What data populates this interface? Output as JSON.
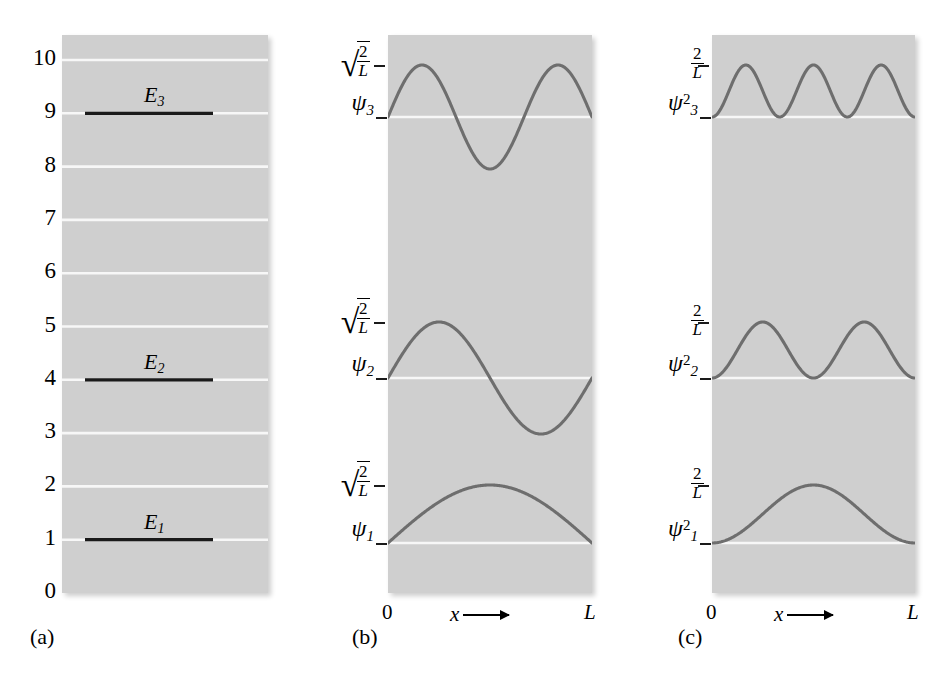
{
  "figure": {
    "background_color": "#ffffff",
    "panel_fill_color": "#cfcfcf",
    "gridline_color": "#f7f7f7",
    "curve_color": "#6e6e6e",
    "level_line_color": "#1a1a1a"
  },
  "captions": {
    "a": "(a)",
    "b": "(b)",
    "c": "(c)"
  },
  "panel_a": {
    "name": "energy-level-diagram",
    "y_tick_labels": [
      "10",
      "9",
      "8",
      "7",
      "6",
      "5",
      "4",
      "3",
      "2",
      "1",
      "0"
    ],
    "y_tick_values": [
      10,
      9,
      8,
      7,
      6,
      5,
      4,
      3,
      2,
      1,
      0
    ],
    "levels": [
      {
        "label": "E",
        "subscript": "3",
        "value": 9
      },
      {
        "label": "E",
        "subscript": "2",
        "value": 4
      },
      {
        "label": "E",
        "subscript": "1",
        "value": 1
      }
    ]
  },
  "panel_b": {
    "name": "wavefunction-panel",
    "amplitude_label": {
      "radical": "√",
      "numerator": "2",
      "denominator": "L"
    },
    "baseline_labels": [
      {
        "symbol": "ψ",
        "subscript": "3",
        "superscript": ""
      },
      {
        "symbol": "ψ",
        "subscript": "2",
        "superscript": ""
      },
      {
        "symbol": "ψ",
        "subscript": "1",
        "superscript": ""
      }
    ],
    "x_axis": {
      "left": "0",
      "variable": "x",
      "right": "L"
    }
  },
  "panel_c": {
    "name": "probability-density-panel",
    "amplitude_label": {
      "numerator": "2",
      "denominator": "L"
    },
    "baseline_labels": [
      {
        "symbol": "ψ",
        "subscript": "3",
        "superscript": "2"
      },
      {
        "symbol": "ψ",
        "subscript": "2",
        "superscript": "2"
      },
      {
        "symbol": "ψ",
        "subscript": "1",
        "superscript": "2"
      }
    ],
    "x_axis": {
      "left": "0",
      "variable": "x",
      "right": "L"
    }
  },
  "chart_data": {
    "type": "line",
    "panels": [
      {
        "id": "a",
        "label": "(a)",
        "type": "bar",
        "description": "Horizontal energy level lines on a gridded scale of relative energy",
        "ylabel": "",
        "ylim": [
          0,
          10
        ],
        "yticks": [
          0,
          1,
          2,
          3,
          4,
          5,
          6,
          7,
          8,
          9,
          10
        ],
        "ytick_labels": [
          "0",
          "1",
          "2",
          "3",
          "4",
          "5",
          "6",
          "7",
          "8",
          "9",
          "10"
        ],
        "grid": true,
        "categories": [
          "E1",
          "E2",
          "E3"
        ],
        "values": [
          1,
          4,
          9
        ],
        "annotations": [
          "E_1 at 1",
          "E_2 at 4",
          "E_3 at 9"
        ]
      },
      {
        "id": "b",
        "label": "(b)",
        "type": "line",
        "description": "Wavefunctions psi_n = sqrt(2/L) sin(n pi x / L) plotted from x=0 to x=L",
        "xlabel": "x",
        "xlim": [
          0,
          1
        ],
        "xtick_labels": [
          "0",
          "L"
        ],
        "grid": false,
        "series": [
          {
            "name": "psi_3",
            "n": 3,
            "amplitude": 1,
            "baseline": 0,
            "half_periods": 3,
            "peaks": 2,
            "troughs": 1
          },
          {
            "name": "psi_2",
            "n": 2,
            "amplitude": 1,
            "baseline": 0,
            "half_periods": 2,
            "peaks": 1,
            "troughs": 1
          },
          {
            "name": "psi_1",
            "n": 1,
            "amplitude": 1,
            "baseline": 0,
            "half_periods": 1,
            "peaks": 1,
            "troughs": 0
          }
        ],
        "amplitude_tick": "sqrt(2/L)"
      },
      {
        "id": "c",
        "label": "(c)",
        "type": "line",
        "description": "Probability densities psi_n squared = (2/L) sin^2(n pi x / L) plotted from x=0 to x=L",
        "xlabel": "x",
        "xlim": [
          0,
          1
        ],
        "xtick_labels": [
          "0",
          "L"
        ],
        "grid": false,
        "series": [
          {
            "name": "psi_3_squared",
            "n": 3,
            "amplitude": 1,
            "baseline": 0,
            "lobes": 3
          },
          {
            "name": "psi_2_squared",
            "n": 2,
            "amplitude": 1,
            "baseline": 0,
            "lobes": 2
          },
          {
            "name": "psi_1_squared",
            "n": 1,
            "amplitude": 1,
            "baseline": 0,
            "lobes": 1
          }
        ],
        "amplitude_tick": "2/L"
      }
    ]
  }
}
